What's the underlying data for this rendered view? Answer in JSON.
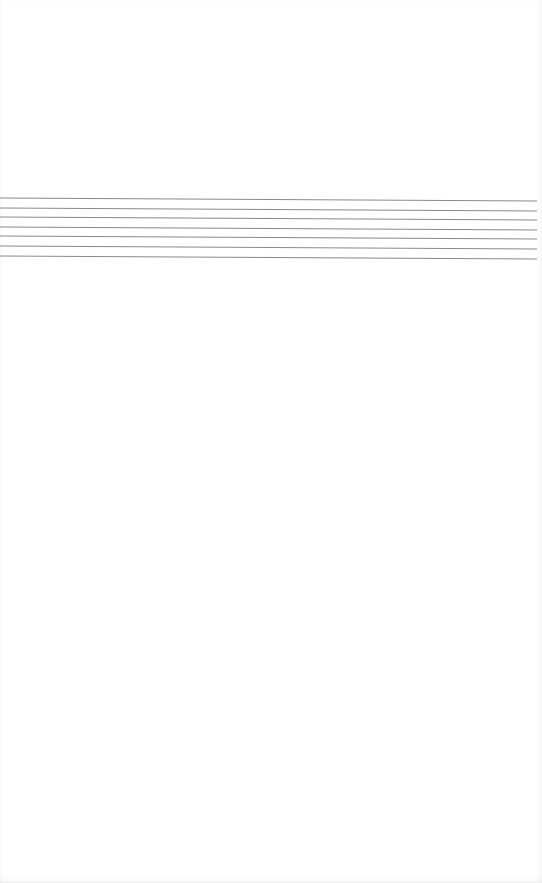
{
  "page": {
    "background": "#ffffff",
    "rules": {
      "count": 7,
      "color": "#8a8a8a",
      "left_x": 0,
      "right_x": 537,
      "left_y": [
        198,
        208,
        217,
        227,
        236,
        246,
        256
      ],
      "right_y": [
        201,
        211,
        220,
        230,
        239,
        249,
        259
      ]
    }
  }
}
